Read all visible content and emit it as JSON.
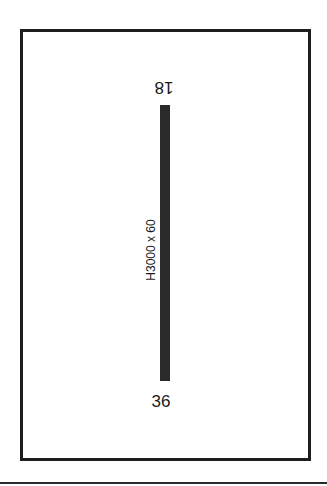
{
  "diagram": {
    "type": "airport-runway-diagram",
    "runway": {
      "end_north": "18",
      "end_south": "36",
      "dimensions_label": "H3000 x 60",
      "color": "#2a2a2a"
    },
    "frame_color": "#1e1e1e"
  }
}
